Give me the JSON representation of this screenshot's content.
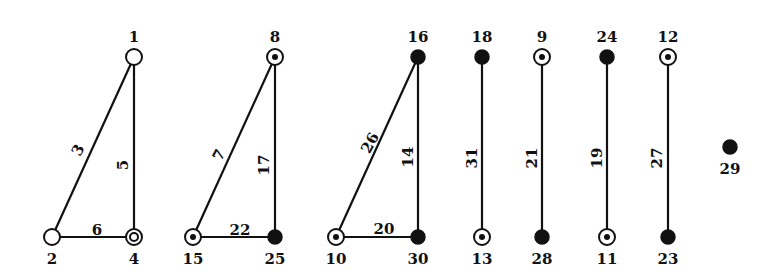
{
  "diagram": {
    "type": "graph",
    "node_styles": {
      "open": "hollow circle",
      "double": "double circle",
      "dot": "circle with center dot",
      "filled": "filled black circle"
    },
    "nodes": [
      {
        "id": "1",
        "x": 134,
        "y": 57,
        "style": "open",
        "label_pos": "above"
      },
      {
        "id": "2",
        "x": 52,
        "y": 237,
        "style": "open",
        "label_pos": "below"
      },
      {
        "id": "4",
        "x": 134,
        "y": 237,
        "style": "double",
        "label_pos": "below"
      },
      {
        "id": "8",
        "x": 275,
        "y": 57,
        "style": "dot",
        "label_pos": "above"
      },
      {
        "id": "15",
        "x": 193,
        "y": 237,
        "style": "dot",
        "label_pos": "below"
      },
      {
        "id": "25",
        "x": 275,
        "y": 237,
        "style": "filled",
        "label_pos": "below"
      },
      {
        "id": "16",
        "x": 418,
        "y": 57,
        "style": "filled",
        "label_pos": "above"
      },
      {
        "id": "10",
        "x": 336,
        "y": 237,
        "style": "dot",
        "label_pos": "below"
      },
      {
        "id": "30",
        "x": 418,
        "y": 237,
        "style": "filled",
        "label_pos": "below"
      },
      {
        "id": "18",
        "x": 482,
        "y": 57,
        "style": "filled",
        "label_pos": "above"
      },
      {
        "id": "13",
        "x": 482,
        "y": 237,
        "style": "dot",
        "label_pos": "below"
      },
      {
        "id": "9",
        "x": 542,
        "y": 57,
        "style": "dot",
        "label_pos": "above"
      },
      {
        "id": "28",
        "x": 542,
        "y": 237,
        "style": "filled",
        "label_pos": "below"
      },
      {
        "id": "24",
        "x": 607,
        "y": 57,
        "style": "filled",
        "label_pos": "above"
      },
      {
        "id": "11",
        "x": 607,
        "y": 237,
        "style": "dot",
        "label_pos": "below"
      },
      {
        "id": "12",
        "x": 668,
        "y": 57,
        "style": "dot",
        "label_pos": "above"
      },
      {
        "id": "23",
        "x": 668,
        "y": 237,
        "style": "filled",
        "label_pos": "below"
      },
      {
        "id": "29",
        "x": 730,
        "y": 147,
        "style": "filled",
        "label_pos": "below"
      }
    ],
    "edges": [
      {
        "id": "3",
        "from": "1",
        "to": "2",
        "lx": 78,
        "ly": 150,
        "rot": -62
      },
      {
        "id": "5",
        "from": "1",
        "to": "4",
        "lx": 123,
        "ly": 165,
        "rot": -90
      },
      {
        "id": "6",
        "from": "2",
        "to": "4",
        "lx": 97,
        "ly": 230,
        "rot": 0
      },
      {
        "id": "7",
        "from": "8",
        "to": "15",
        "lx": 219,
        "ly": 155,
        "rot": -62
      },
      {
        "id": "17",
        "from": "8",
        "to": "25",
        "lx": 264,
        "ly": 165,
        "rot": -90
      },
      {
        "id": "22",
        "from": "15",
        "to": "25",
        "lx": 240,
        "ly": 230,
        "rot": 0
      },
      {
        "id": "26",
        "from": "16",
        "to": "10",
        "lx": 370,
        "ly": 143,
        "rot": -62
      },
      {
        "id": "14",
        "from": "16",
        "to": "30",
        "lx": 408,
        "ly": 157,
        "rot": -90
      },
      {
        "id": "20",
        "from": "10",
        "to": "30",
        "lx": 384,
        "ly": 229,
        "rot": 0
      },
      {
        "id": "31",
        "from": "18",
        "to": "13",
        "lx": 472,
        "ly": 158,
        "rot": -90
      },
      {
        "id": "21",
        "from": "9",
        "to": "28",
        "lx": 532,
        "ly": 158,
        "rot": -90
      },
      {
        "id": "19",
        "from": "24",
        "to": "11",
        "lx": 597,
        "ly": 158,
        "rot": -90
      },
      {
        "id": "27",
        "from": "12",
        "to": "23",
        "lx": 657,
        "ly": 158,
        "rot": -90
      }
    ]
  }
}
